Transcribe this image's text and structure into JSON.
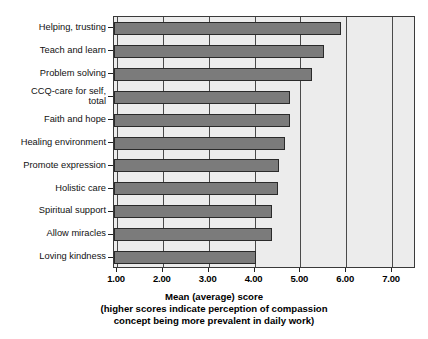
{
  "chart_data": {
    "type": "bar",
    "orientation": "horizontal",
    "title": "",
    "xlabel": "Mean (average) score",
    "xlabel_note_line1": "(higher scores indicate perception of compassion",
    "xlabel_note_line2": "concept being more prevalent in daily work)",
    "ylabel": "",
    "xlim": [
      1.0,
      7.0
    ],
    "xticks": [
      1.0,
      2.0,
      3.0,
      4.0,
      5.0,
      6.0,
      7.0
    ],
    "xticklabels": [
      "1.00",
      "2.00",
      "3.00",
      "4.00",
      "5.00",
      "6.00",
      "7.00"
    ],
    "grid": true,
    "legend": "none",
    "categories": [
      "Helping, trusting",
      "Teach and learn",
      "Problem solving",
      "CCQ-care for self, total",
      "Faith and hope",
      "Healing environment",
      "Promote expression",
      "Holistic care",
      "Spiritual support",
      "Allow miracles",
      "Loving kindness"
    ],
    "category_label_lines": [
      [
        "Helping, trusting"
      ],
      [
        "Teach and learn"
      ],
      [
        "Problem solving"
      ],
      [
        "CCQ-care for self,",
        "total"
      ],
      [
        "Faith and hope"
      ],
      [
        "Healing environment"
      ],
      [
        "Promote expression"
      ],
      [
        "Holistic care"
      ],
      [
        "Spiritual support"
      ],
      [
        "Allow miracles"
      ],
      [
        "Loving kindness"
      ]
    ],
    "values": [
      5.88,
      5.52,
      5.25,
      4.78,
      4.78,
      4.66,
      4.54,
      4.52,
      4.38,
      4.38,
      4.04
    ],
    "bar_color": "#7b7b7b",
    "bar_edge_color": "#2a2a2a",
    "plot_background": "#ececec",
    "grid_color": "#4a4a4a"
  }
}
